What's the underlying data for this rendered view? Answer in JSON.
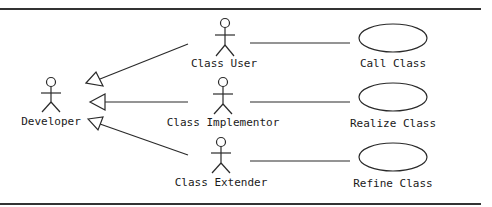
{
  "diagram": {
    "type": "UML use case diagram",
    "colors": {
      "stroke": "#2a2a2a",
      "border": "#333333",
      "background": "#ffffff",
      "text": "#1a1a1a"
    },
    "actors": [
      {
        "id": "developer",
        "label": "Developer",
        "x": 51,
        "y": 82
      },
      {
        "id": "class-user",
        "label": "Class User",
        "x": 225,
        "y": 24
      },
      {
        "id": "class-implementor",
        "label": "Class Implementor",
        "x": 223,
        "y": 83
      },
      {
        "id": "class-extender",
        "label": "Class Extender",
        "x": 221,
        "y": 142
      }
    ],
    "use_cases": [
      {
        "id": "call-class",
        "label": "Call Class",
        "cx": 393,
        "cy": 38
      },
      {
        "id": "realize-class",
        "label": "Realize Class",
        "cx": 393,
        "cy": 97
      },
      {
        "id": "refine-class",
        "label": "Refine Class",
        "cx": 393,
        "cy": 157
      }
    ],
    "generalizations": [
      {
        "from": "class-user",
        "to": "developer"
      },
      {
        "from": "class-implementor",
        "to": "developer"
      },
      {
        "from": "class-extender",
        "to": "developer"
      }
    ],
    "associations": [
      {
        "from": "class-user",
        "to": "call-class"
      },
      {
        "from": "class-implementor",
        "to": "realize-class"
      },
      {
        "from": "class-extender",
        "to": "refine-class"
      }
    ]
  }
}
